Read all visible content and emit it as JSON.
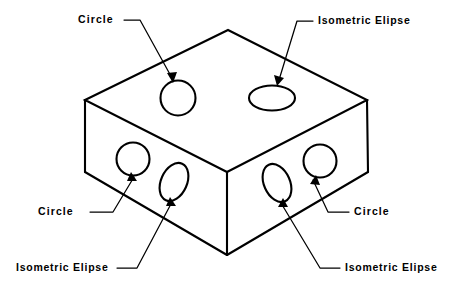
{
  "diagram": {
    "type": "isometric-technical-illustration",
    "stroke_color": "#000000",
    "background_color": "#ffffff",
    "fill_color": "#ffffff"
  },
  "labels": {
    "top_left": "Circle",
    "top_right": "Isometric Elipse",
    "mid_left": "Circle",
    "mid_right": "Circle",
    "bottom_left": "Isometric Elipse",
    "bottom_right": "Isometric Elipse"
  },
  "holes": [
    {
      "id": "top-face-circle",
      "shape": "circle",
      "face": "top",
      "label": "Circle"
    },
    {
      "id": "top-face-ellipse",
      "shape": "ellipse",
      "face": "top",
      "label": "Isometric Elipse"
    },
    {
      "id": "left-face-circle",
      "shape": "circle",
      "face": "left",
      "label": "Circle"
    },
    {
      "id": "left-face-ellipse",
      "shape": "ellipse",
      "face": "left",
      "label": "Isometric Elipse"
    },
    {
      "id": "right-face-ellipse",
      "shape": "ellipse",
      "face": "right",
      "label": "Isometric Elipse"
    },
    {
      "id": "right-face-circle",
      "shape": "circle",
      "face": "right",
      "label": "Circle"
    }
  ]
}
